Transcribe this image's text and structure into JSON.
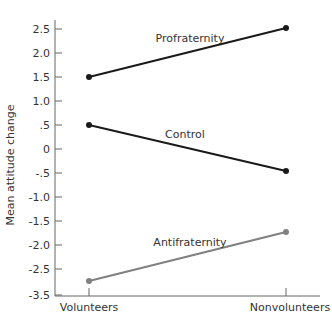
{
  "chart_data": {
    "type": "line",
    "title": "",
    "xlabel": "",
    "ylabel": "Mean attitude change",
    "categories": [
      "Volunteers",
      "Nonvolunteers"
    ],
    "y_ticks": [
      "2.5",
      "2.0",
      "1.5",
      "1.0",
      ".5",
      "0",
      "-.5",
      "-1.0",
      "-1.5",
      "-2.0",
      "-2.5",
      "-3.5"
    ],
    "ylim": [
      -3.5,
      2.5
    ],
    "grid": false,
    "legend": "inline labels",
    "series": [
      {
        "name": "Profraternity",
        "values": [
          1.5,
          2.55
        ],
        "color": "#1a1a1a"
      },
      {
        "name": "Control",
        "values": [
          0.5,
          -0.45
        ],
        "color": "#1a1a1a"
      },
      {
        "name": "Antifraternity",
        "values": [
          -2.75,
          -1.75
        ],
        "color": "#808080"
      }
    ]
  }
}
